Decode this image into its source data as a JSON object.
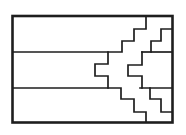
{
  "figure": {
    "background": "#ffffff",
    "stroke_color": "#1e1e1e",
    "outer_stroke_width": 2.6,
    "inner_stroke_width": 1.7,
    "frame": {
      "x": 12.5,
      "y": 16,
      "width": 160,
      "height": 106.5
    },
    "lines": [
      {
        "name": "top-band-bottom-edge",
        "points": "13,52 122,52 122,41 134,41 134,29 146,29 146,16"
      },
      {
        "name": "top-right-staircase",
        "points": "172,29 161,29 161,41 151,41 151,52"
      },
      {
        "name": "right-band-top-edge",
        "points": "142,52 172,52"
      },
      {
        "name": "right-notch",
        "points": "142,52 142,65 128,65 128,76 142,76 142,88"
      },
      {
        "name": "left-notch",
        "points": "108,52 108,64 95,64 95,76 108,76 108,88"
      },
      {
        "name": "bottom-band-top-edge",
        "points": "13,88 121,88 121,99 134,99 134,112 146,112 146,122"
      },
      {
        "name": "right-band-bottom-edge",
        "points": "140,88 172,88"
      },
      {
        "name": "bottom-right-staircase",
        "points": "150,88 150,99 161,99 161,112 172,112"
      }
    ]
  }
}
